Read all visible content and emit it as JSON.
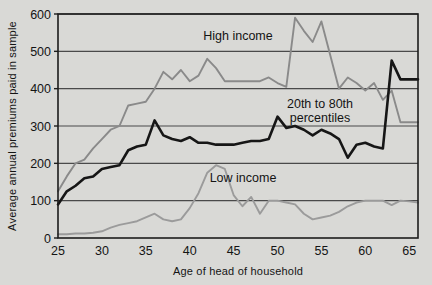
{
  "chart_data": {
    "type": "line",
    "title": "",
    "xlabel": "Age of head of household",
    "ylabel": "Average annual premiums paid in sample",
    "xlim": [
      25,
      66
    ],
    "ylim": [
      0,
      600
    ],
    "xticks": [
      25,
      30,
      35,
      40,
      45,
      50,
      55,
      60,
      65
    ],
    "yticks": [
      0,
      100,
      200,
      300,
      400,
      500,
      600
    ],
    "grid": true,
    "legend_position": "inline-annotations",
    "annotations": [
      {
        "text": "High income",
        "x": 41.5,
        "y": 540
      },
      {
        "text": "20th to 80th percentiles",
        "x": 53.5,
        "y": 330
      },
      {
        "text": "Low income",
        "x": 44.5,
        "y": 160
      }
    ],
    "colors": {
      "high_income": "#8a8a8a",
      "percentiles": "#161616",
      "low_income": "#9b9b9b",
      "background": "#d9d9d6",
      "axis": "#1c1c1c",
      "grid": "#4a4a4a"
    },
    "x": [
      25,
      26,
      27,
      28,
      29,
      30,
      31,
      32,
      33,
      34,
      35,
      36,
      37,
      38,
      39,
      40,
      41,
      42,
      43,
      44,
      45,
      46,
      47,
      48,
      49,
      50,
      51,
      52,
      53,
      54,
      55,
      56,
      57,
      58,
      59,
      60,
      61,
      62,
      63,
      64,
      65,
      66
    ],
    "series": [
      {
        "name": "High income",
        "color": "#8a8a8a",
        "values": [
          125,
          165,
          200,
          210,
          240,
          265,
          290,
          300,
          355,
          360,
          365,
          400,
          445,
          425,
          450,
          420,
          435,
          480,
          455,
          420,
          420,
          420,
          420,
          420,
          430,
          415,
          405,
          590,
          555,
          525,
          580,
          490,
          400,
          430,
          415,
          395,
          415,
          370,
          395,
          310,
          310,
          310
        ]
      },
      {
        "name": "20th to 80th percentiles",
        "color": "#161616",
        "values": [
          90,
          125,
          140,
          160,
          165,
          185,
          190,
          195,
          235,
          245,
          250,
          315,
          275,
          265,
          260,
          270,
          255,
          255,
          250,
          250,
          250,
          255,
          260,
          260,
          265,
          325,
          295,
          300,
          290,
          275,
          290,
          280,
          265,
          215,
          250,
          255,
          245,
          240,
          475,
          425,
          425,
          425
        ]
      },
      {
        "name": "Low income",
        "color": "#9b9b9b",
        "values": [
          10,
          10,
          12,
          12,
          14,
          18,
          28,
          35,
          40,
          45,
          55,
          65,
          50,
          45,
          50,
          80,
          120,
          175,
          195,
          185,
          115,
          85,
          110,
          65,
          100,
          100,
          95,
          90,
          65,
          50,
          55,
          60,
          70,
          85,
          95,
          100,
          100,
          100,
          88,
          100,
          98,
          95
        ]
      }
    ]
  },
  "axis_labels": {
    "y": "Average annual premiums paid in sample",
    "x": "Age of head of household"
  },
  "series_names": {
    "high": "High income",
    "percentiles_line1": "20th to 80th",
    "percentiles_line2": "percentiles",
    "low": "Low income"
  },
  "ticks": {
    "y": [
      "600",
      "500",
      "400",
      "300",
      "200",
      "100",
      "0"
    ],
    "x": [
      "25",
      "30",
      "35",
      "40",
      "45",
      "50",
      "55",
      "60",
      "65"
    ]
  }
}
